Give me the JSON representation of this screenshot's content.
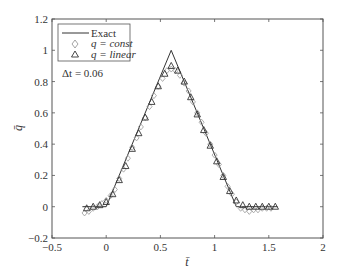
{
  "chart_data": {
    "type": "line",
    "title": "",
    "xlabel": "t̄",
    "ylabel": "q̄",
    "xlim": [
      -0.5,
      2
    ],
    "ylim": [
      -0.2,
      1.2
    ],
    "xticks": [
      -0.5,
      0,
      0.5,
      1,
      1.5,
      2
    ],
    "xtick_labels": [
      "−0.5",
      "0",
      "0.5",
      "1",
      "1.5",
      "2"
    ],
    "yticks": [
      -0.2,
      0,
      0.2,
      0.4,
      0.6,
      0.8,
      1,
      1.2
    ],
    "ytick_labels": [
      "−0.2",
      "0",
      "0.2",
      "0.4",
      "0.6",
      "0.8",
      "1",
      "1.2"
    ],
    "grid": false,
    "legend_position": "upper left",
    "annotation": "Δt = 0.06",
    "series": [
      {
        "name": "Exact",
        "style": "line",
        "color": "#333333",
        "x": [
          -0.22,
          0.0,
          0.6,
          1.2,
          1.58
        ],
        "y": [
          0.0,
          0.0,
          1.0,
          0.0,
          0.0
        ]
      },
      {
        "name": "q = const",
        "style": "diamond",
        "color": "#999999",
        "x": [
          -0.2,
          -0.16,
          -0.12,
          -0.08,
          -0.04,
          0.0,
          0.04,
          0.08,
          0.12,
          0.16,
          0.2,
          0.24,
          0.28,
          0.32,
          0.36,
          0.4,
          0.44,
          0.48,
          0.52,
          0.56,
          0.6,
          0.64,
          0.68,
          0.72,
          0.76,
          0.8,
          0.84,
          0.88,
          0.92,
          0.96,
          1.0,
          1.04,
          1.08,
          1.12,
          1.16,
          1.2,
          1.24,
          1.28,
          1.32,
          1.36,
          1.4,
          1.44,
          1.48,
          1.52
        ],
        "y": [
          -0.04,
          -0.03,
          -0.01,
          0.0,
          0.02,
          0.04,
          0.07,
          0.11,
          0.18,
          0.24,
          0.31,
          0.38,
          0.44,
          0.51,
          0.57,
          0.64,
          0.71,
          0.77,
          0.82,
          0.87,
          0.88,
          0.87,
          0.84,
          0.79,
          0.74,
          0.67,
          0.6,
          0.54,
          0.47,
          0.4,
          0.33,
          0.27,
          0.2,
          0.13,
          0.08,
          0.03,
          -0.01,
          -0.02,
          -0.03,
          -0.02,
          -0.02,
          -0.01,
          -0.01,
          -0.01
        ]
      },
      {
        "name": "q = linear",
        "style": "triangle",
        "color": "#333333",
        "x": [
          -0.18,
          -0.12,
          -0.06,
          0.0,
          0.06,
          0.12,
          0.18,
          0.24,
          0.3,
          0.36,
          0.42,
          0.48,
          0.54,
          0.6,
          0.66,
          0.72,
          0.78,
          0.84,
          0.9,
          0.96,
          1.02,
          1.08,
          1.14,
          1.2,
          1.26,
          1.32,
          1.38,
          1.44,
          1.5,
          1.56
        ],
        "y": [
          -0.01,
          0.0,
          0.01,
          0.03,
          0.08,
          0.17,
          0.26,
          0.37,
          0.47,
          0.57,
          0.67,
          0.77,
          0.85,
          0.9,
          0.87,
          0.8,
          0.7,
          0.59,
          0.49,
          0.39,
          0.29,
          0.19,
          0.1,
          0.04,
          0.01,
          0.0,
          0.0,
          0.0,
          0.0,
          0.0
        ]
      }
    ]
  },
  "legend": {
    "exact_label": "Exact",
    "const_label": "q = const",
    "linear_label": "q = linear"
  }
}
